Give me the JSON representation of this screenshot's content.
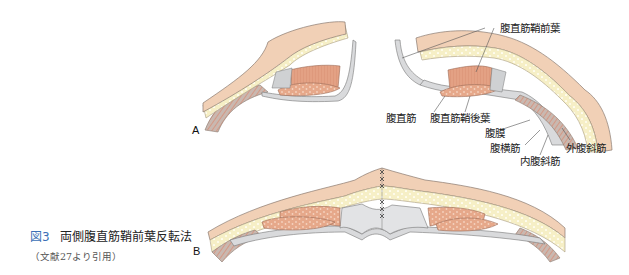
{
  "figure": {
    "number": "図3",
    "title": "両側腹直筋鞘前葉反転法",
    "source": "（文献27より引用）"
  },
  "panels": {
    "a": {
      "letter": "A"
    },
    "b": {
      "letter": "B"
    }
  },
  "labels": {
    "anterior_sheath": "腹直筋鞘前葉",
    "rectus": "腹直筋",
    "posterior_sheath": "腹直筋鞘後葉",
    "peritoneum": "腹膜",
    "transversus": "腹横筋",
    "external_oblique": "外腹斜筋",
    "internal_oblique": "内腹斜筋"
  },
  "colors": {
    "skin": "#f1d0b6",
    "fat": "#f6efc6",
    "muscle": "#e39a7c",
    "fascia": "#d9dadc",
    "caption_accent": "#3b6fb6",
    "outline": "#8a7a70"
  }
}
